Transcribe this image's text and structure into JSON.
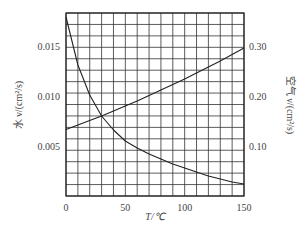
{
  "chart_data": {
    "type": "line",
    "title": "",
    "xlabel": "T/℃",
    "ylabel_left": "水 ν/(cm²/s)",
    "ylabel_right": "空气 ν/(cm²/s)",
    "xlim": [
      0,
      150
    ],
    "ylim_left": [
      0,
      0.0183
    ],
    "ylim_right": [
      0,
      0.366
    ],
    "x_ticks": [
      0,
      50,
      100,
      150
    ],
    "x_tick_labels": [
      "0",
      "50",
      "100",
      "150"
    ],
    "y_left_ticks": [
      0.005,
      0.01,
      0.015
    ],
    "y_left_tick_labels": [
      "0.005",
      "0.010",
      "0.015"
    ],
    "y_right_ticks": [
      0.1,
      0.2,
      0.3
    ],
    "y_right_tick_labels": [
      "0.10",
      "0.20",
      "0.30"
    ],
    "grid": true,
    "grid_x_step": 10,
    "grid_rows": 16,
    "legend": "none",
    "series": [
      {
        "name": "Water kinematic viscosity",
        "axis": "left",
        "x": [
          0,
          10,
          20,
          30,
          40,
          50,
          60,
          70,
          80,
          90,
          100,
          110,
          120,
          130,
          140,
          150
        ],
        "values": [
          0.0179,
          0.0131,
          0.0101,
          0.008,
          0.0066,
          0.0055,
          0.0048,
          0.0042,
          0.0037,
          0.0032,
          0.0028,
          0.0024,
          0.002,
          0.0017,
          0.0014,
          0.0012
        ]
      },
      {
        "name": "Air kinematic viscosity",
        "axis": "right",
        "x": [
          0,
          10,
          20,
          30,
          40,
          50,
          60,
          70,
          80,
          90,
          100,
          110,
          120,
          130,
          140,
          150
        ],
        "values": [
          0.133,
          0.142,
          0.151,
          0.16,
          0.17,
          0.18,
          0.19,
          0.201,
          0.212,
          0.223,
          0.234,
          0.246,
          0.258,
          0.27,
          0.283,
          0.296
        ]
      }
    ]
  }
}
